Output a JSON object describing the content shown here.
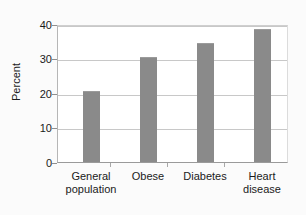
{
  "chart_data": {
    "type": "bar",
    "title": "",
    "xlabel": "",
    "ylabel": "Percent",
    "categories": [
      "General population",
      "Obese",
      "Diabetes",
      "Heart disease"
    ],
    "category_lines": [
      [
        "General",
        "population"
      ],
      [
        "Obese"
      ],
      [
        "Diabetes"
      ],
      [
        "Heart",
        "disease"
      ]
    ],
    "values": [
      21,
      31,
      35,
      39
    ],
    "ylim": [
      0,
      40
    ],
    "yticks": [
      0,
      10,
      20,
      30,
      40
    ],
    "ytick_labels": [
      "0",
      "10",
      "20",
      "30",
      "40"
    ],
    "grid": true,
    "legend": false,
    "bar_color": "#8a8a8a",
    "plot_background": "#ffffff",
    "figure_background": "#fbfbfb",
    "gridline_color": "#c8c8c8",
    "axis_color": "#9a9a9a",
    "text_color": "#1a1a1a"
  }
}
